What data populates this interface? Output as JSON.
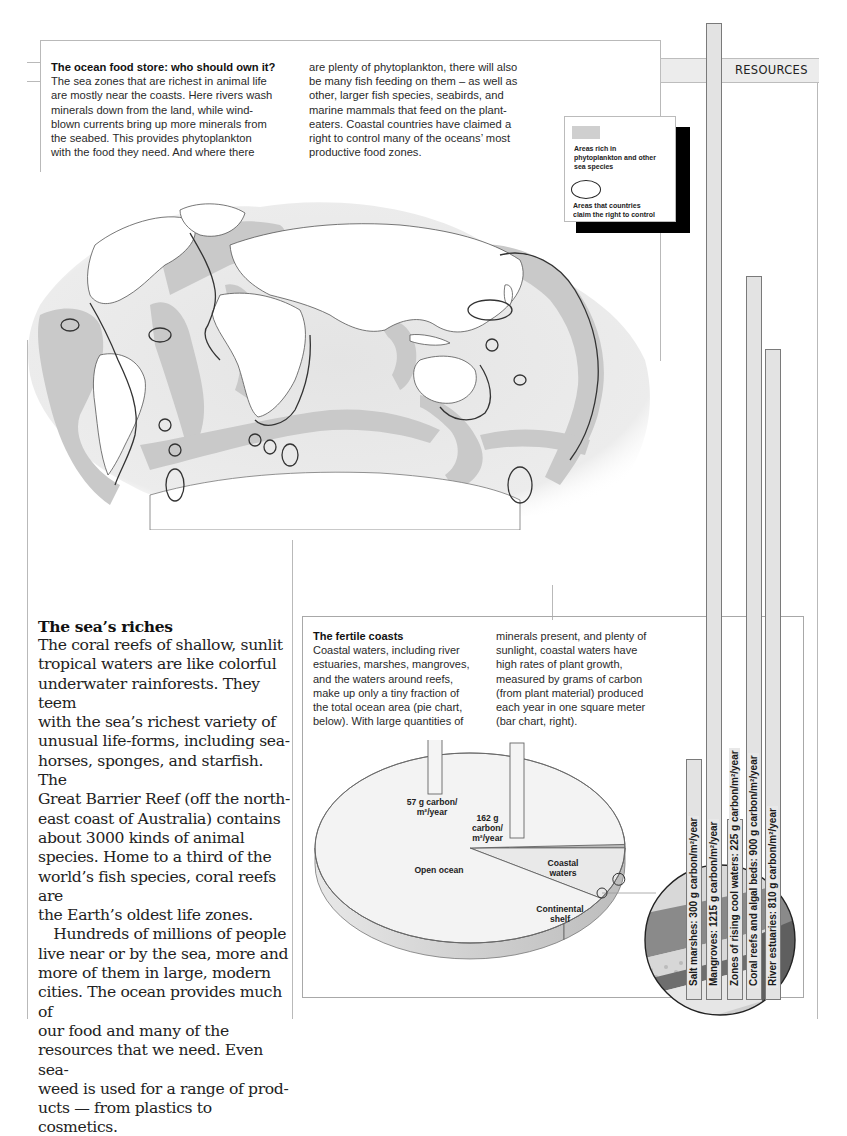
{
  "section_tab": "RESOURCES",
  "ocean_food_store": {
    "title": "The ocean food store: who should own it?",
    "col1_lines": [
      "The sea zones that are richest in animal life",
      "are mostly near the coasts. Here rivers wash",
      "minerals down from the land, while wind-",
      "blown currents bring up more minerals from",
      "the seabed. This provides phytoplankton",
      "with the food they need. And where there"
    ],
    "col2_lines": [
      "are plenty of phytoplankton, there will also",
      "be many fish feeding on them – as well as",
      "other, larger fish species, seabirds, and",
      "marine mammals that feed on the plant-",
      "eaters. Coastal countries have claimed a",
      "right to control many of the oceans’ most",
      "productive food zones."
    ]
  },
  "map_legend": {
    "items": [
      {
        "symbol": "shaded-area",
        "color": "#cfcfcf",
        "label_lines": [
          "Areas rich in",
          "phytoplankton and other",
          "sea species"
        ]
      },
      {
        "symbol": "outline-oval",
        "label_lines": [
          "Areas that countries",
          "claim the right to control"
        ]
      }
    ]
  },
  "seas_riches": {
    "title": "The sea’s riches",
    "lines": [
      "The coral reefs of shallow, sunlit",
      "tropical waters are like colorful",
      "underwater rainforests. They teem",
      "with the sea’s richest variety of",
      "unusual life-forms, including sea-",
      "horses, sponges, and starfish. The",
      "Great Barrier Reef (off the north-",
      "east coast of Australia) contains",
      "about 3000 kinds of animal",
      "species. Home to a third of the",
      "world’s fish species, coral reefs are",
      "the Earth’s oldest life zones.",
      " Hundreds of millions of people",
      "live near or by the sea, more and",
      "more of them in large, modern",
      "cities. The ocean provides much of",
      "our food and many of the",
      "resources that we need. Even sea-",
      "weed is used for a range of prod-",
      "ucts — from plastics to cosmetics."
    ]
  },
  "fertile_coasts": {
    "title": "The fertile coasts",
    "col1_lines": [
      "Coastal waters, including river",
      "estuaries, marshes, mangroves,",
      "and the waters around reefs,",
      "make up only a tiny fraction of",
      "the total ocean area (pie chart,",
      "below). With large quantities of"
    ],
    "col2_lines": [
      "minerals present, and plenty of",
      "sunlight, coastal waters have",
      "high rates of plant growth,",
      "measured by grams of carbon",
      "(from plant material) produced",
      "each year in one square meter",
      "(bar chart, right)."
    ]
  },
  "chart_data": [
    {
      "type": "pie",
      "title": "Share of total ocean area",
      "slices": [
        {
          "label": "Open ocean",
          "share_pct": 90.5,
          "productivity": "57 g carbon/ m²/year"
        },
        {
          "label": "Continental shelf",
          "share_pct": 8.5,
          "productivity": "162 g carbon/ m²/year"
        },
        {
          "label": "Coastal waters",
          "share_pct": 1.0
        }
      ],
      "bar_annotations": [
        {
          "slice": "Open ocean",
          "value": 57,
          "label_lines": [
            "57 g carbon/",
            "m²/year"
          ]
        },
        {
          "slice": "Continental shelf",
          "value": 162,
          "label_lines": [
            "162 g",
            "carbon/",
            "m²/year"
          ]
        }
      ]
    },
    {
      "type": "bar",
      "orientation": "vertical",
      "title": "Plant growth in coastal waters",
      "unit": "g carbon/m²/year",
      "categories": [
        "Salt marshes",
        "Mangroves",
        "Zones of rising cool waters",
        "Coral reefs and algal beds",
        "River estuaries"
      ],
      "values": [
        300,
        1215,
        225,
        900,
        810
      ],
      "labels": [
        "Salt marshes: 300 g carbon/m²/year",
        "Mangroves: 1215 g carbon/m²/year",
        "Zones of rising cool waters: 225 g carbon/m²/year",
        "Coral reefs and algal beds: 900 g carbon/m²/year",
        "River estuaries: 810 g carbon/m²/year"
      ]
    }
  ]
}
